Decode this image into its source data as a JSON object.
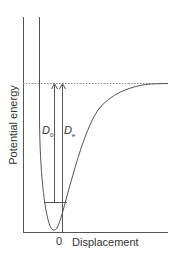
{
  "diagram": {
    "title": "",
    "axes": {
      "y_label": "Potential energy",
      "x_label": "Displacement",
      "x_origin_tick": "0"
    },
    "labels": {
      "d0": {
        "main": "D",
        "sub": "0"
      },
      "de": {
        "main": "D",
        "sub": "e"
      }
    },
    "elements": [
      "potential-energy-curve (Morse-like well)",
      "dissociation-limit (dotted horizontal line)",
      "zero-point-energy level (horizontal line in well)",
      "D0 arrow from zero-point level to dissociation limit",
      "De arrow from well minimum to dissociation limit"
    ],
    "colors": {
      "line": "#555555",
      "text": "#333333",
      "dotted": "#888888"
    }
  }
}
